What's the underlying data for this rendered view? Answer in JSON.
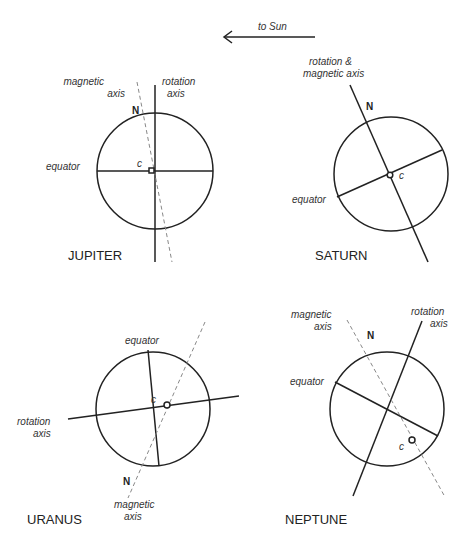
{
  "sun_arrow": {
    "label": "to Sun"
  },
  "planets": {
    "jupiter": {
      "title": "JUPITER",
      "magnetic_label_1": "magnetic",
      "magnetic_label_2": "axis",
      "rotation_label_1": "rotation",
      "rotation_label_2": "axis",
      "equator_label": "equator",
      "north_label": "N",
      "center_label": "c"
    },
    "saturn": {
      "title": "SATURN",
      "axis_label_1": "rotation &",
      "axis_label_2": "magnetic axis",
      "equator_label": "equator",
      "north_label": "N",
      "center_label": "c"
    },
    "uranus": {
      "title": "URANUS",
      "rotation_label_1": "rotation",
      "rotation_label_2": "axis",
      "equator_label": "equator",
      "magnetic_label_1": "magnetic",
      "magnetic_label_2": "axis",
      "north_label": "N",
      "center_label": "c"
    },
    "neptune": {
      "title": "NEPTUNE",
      "magnetic_label_1": "magnetic",
      "magnetic_label_2": "axis",
      "rotation_label_1": "rotation",
      "rotation_label_2": "axis",
      "equator_label": "equator",
      "north_label": "N",
      "center_label": "c"
    }
  }
}
